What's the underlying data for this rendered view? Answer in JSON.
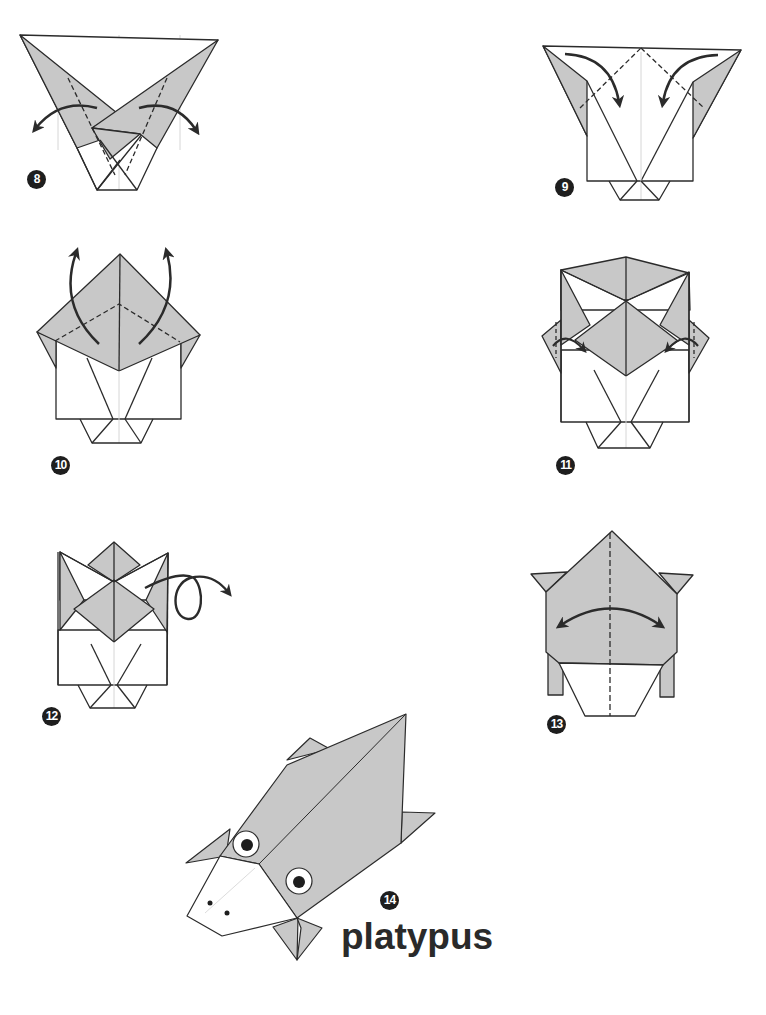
{
  "diagram": {
    "title": "platypus",
    "colors": {
      "paper_colored": "#c8c8c8",
      "paper_white": "#ffffff",
      "line": "#2b2b2b",
      "guide_line": "#cfcfcf",
      "arrow": "#2b2b2b",
      "badge": "#1e1e1e"
    },
    "steps": [
      {
        "number": "8",
        "action": "unfold side flaps outward",
        "arrows": [
          "curved-arrow-left",
          "curved-arrow-right"
        ]
      },
      {
        "number": "9",
        "action": "valley fold top corners down",
        "arrows": [
          "curved-arrow-down-left",
          "curved-arrow-down-right"
        ]
      },
      {
        "number": "10",
        "action": "fold flaps up",
        "arrows": [
          "curved-arrow-up-left",
          "curved-arrow-up-right"
        ]
      },
      {
        "number": "11",
        "action": "fold side tips inward",
        "arrows": [
          "small-arrow-left",
          "small-arrow-right"
        ]
      },
      {
        "number": "12",
        "action": "turn over",
        "arrows": [
          "turn-over-arrow"
        ]
      },
      {
        "number": "13",
        "action": "valley fold in half and unfold",
        "arrows": [
          "double-headed-arrow"
        ]
      },
      {
        "number": "14",
        "action": "finished model",
        "arrows": []
      }
    ]
  }
}
